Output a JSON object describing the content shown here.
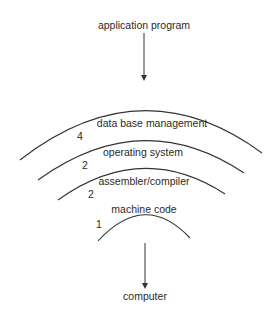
{
  "diagram": {
    "top_label": "application program",
    "bottom_label": "computer",
    "layers": [
      {
        "number": "4",
        "label": "data base management"
      },
      {
        "number": "3",
        "label": "operating system"
      },
      {
        "number": "2",
        "label": "assembler/compiler"
      },
      {
        "number": "1",
        "label": "machine code"
      }
    ],
    "colors": {
      "line": "#333333",
      "text": "#2a2a2a",
      "background": "#ffffff"
    }
  }
}
